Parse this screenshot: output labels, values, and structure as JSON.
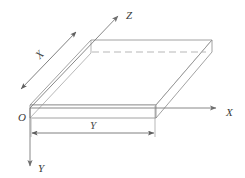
{
  "figure": {
    "kind": "3d-isometric-plate-with-coordinate-axes",
    "background_color": "#ffffff",
    "line_color": "#8a8a8a",
    "hidden_line_color": "#a5a5a5",
    "axis_color": "#7a7a7a",
    "label_color": "#3a3a3a"
  },
  "origin": {
    "label": "O",
    "x": 30,
    "y": 108
  },
  "axes": [
    {
      "name": "x-axis",
      "label": "X",
      "direction": "right",
      "from": [
        30,
        108
      ],
      "to": [
        218,
        108
      ],
      "label_pos": [
        226,
        112
      ]
    },
    {
      "name": "y-axis",
      "label": "Y",
      "direction": "down",
      "from": [
        30,
        108
      ],
      "to": [
        30,
        168
      ],
      "label_pos": [
        38,
        168
      ]
    },
    {
      "name": "z-axis",
      "label": "Z",
      "direction": "up-right-diagonal",
      "from": [
        30,
        108
      ],
      "to": [
        119,
        15
      ],
      "label_pos": [
        126,
        15
      ]
    }
  ],
  "dimensions": [
    {
      "name": "x-dimension",
      "label": "X",
      "orientation": "diagonal",
      "from": [
        76,
        32
      ],
      "to": [
        20,
        90
      ],
      "label_pos": [
        42,
        57
      ],
      "label_rotation": -46
    },
    {
      "name": "y-dimension",
      "label": "Y",
      "orientation": "horizontal",
      "from": [
        31,
        133
      ],
      "to": [
        155,
        133
      ],
      "label_pos": [
        93,
        129
      ]
    }
  ],
  "plate": {
    "name": "rectangular-plate",
    "description": "thin rectangular slab drawn in oblique projection",
    "thickness_px": 13,
    "front_top_left": [
      30,
      105
    ],
    "front_top_right": [
      156,
      105
    ],
    "front_bottom_left": [
      30,
      118
    ],
    "front_bottom_right": [
      156,
      118
    ],
    "back_top_left": [
      91,
      40
    ],
    "back_top_right": [
      212,
      40
    ],
    "back_bottom_right": [
      212,
      52
    ],
    "hidden_edge_from": [
      92,
      52
    ],
    "hidden_edge_to": [
      206,
      52
    ]
  }
}
